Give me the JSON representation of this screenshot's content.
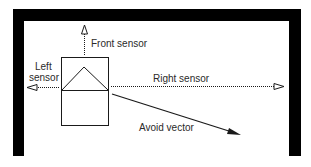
{
  "diagram": {
    "labels": {
      "front_sensor": "Front sensor",
      "left_sensor_line1": "Left",
      "left_sensor_line2": "sensor",
      "right_sensor": "Right sensor",
      "avoid_vector": "Avoid vector"
    },
    "colors": {
      "wall": "#000000",
      "line": "#1a1a1a",
      "text": "#2a2a2a",
      "background": "#ffffff"
    }
  }
}
